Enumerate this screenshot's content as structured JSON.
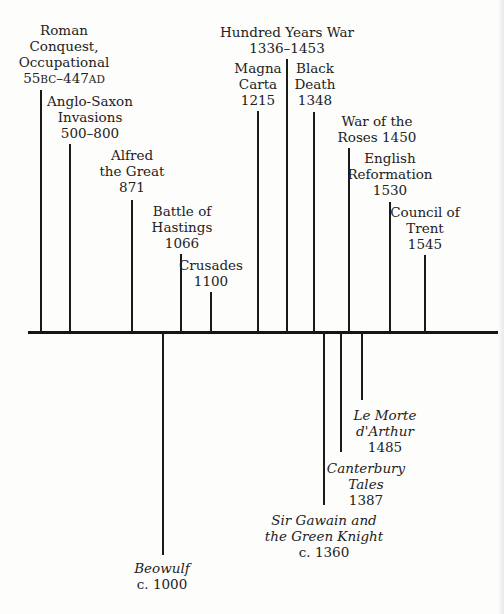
{
  "timeline": {
    "axis_color": "#151515",
    "above": [
      {
        "id": "roman",
        "lines": [
          "Roman",
          "Conquest,",
          "Occupational"
        ],
        "date": "55BC–447AD",
        "x": 41,
        "top": 90,
        "label_x": 64,
        "label_y": 22
      },
      {
        "id": "anglo-saxon",
        "lines": [
          "Anglo-Saxon",
          "Invasions"
        ],
        "date": "500–800",
        "x": 70,
        "top": 144,
        "label_x": 90,
        "label_y": 93
      },
      {
        "id": "alfred",
        "lines": [
          "Alfred",
          "the Great"
        ],
        "date": "871",
        "x": 132,
        "top": 200,
        "label_x": 132,
        "label_y": 147
      },
      {
        "id": "hastings",
        "lines": [
          "Battle of",
          "Hastings"
        ],
        "date": "1066",
        "x": 181,
        "top": 254,
        "label_x": 182,
        "label_y": 203
      },
      {
        "id": "crusades",
        "lines": [
          "Crusades"
        ],
        "date": "1100",
        "x": 211,
        "top": 292,
        "label_x": 211,
        "label_y": 257
      },
      {
        "id": "magna-carta",
        "lines": [
          "Magna",
          "Carta"
        ],
        "date": "1215",
        "x": 258,
        "top": 111,
        "label_x": 258,
        "label_y": 60
      },
      {
        "id": "hundred-years-war",
        "lines": [
          "Hundred Years War"
        ],
        "date": "1336–1453",
        "x": 287,
        "top": 59,
        "label_x": 287,
        "label_y": 24
      },
      {
        "id": "black-death",
        "lines": [
          "Black",
          "Death"
        ],
        "date": "1348",
        "x": 314,
        "top": 112,
        "label_x": 315,
        "label_y": 60
      },
      {
        "id": "war-of-roses",
        "lines": [
          "War of the",
          "Roses 1450"
        ],
        "date": "",
        "x": 349,
        "top": 148,
        "label_x": 377,
        "label_y": 113
      },
      {
        "id": "reformation",
        "lines": [
          "English",
          "Reformation"
        ],
        "date": "1530",
        "x": 390,
        "top": 202,
        "label_x": 390,
        "label_y": 150
      },
      {
        "id": "trent",
        "lines": [
          "Council of",
          "Trent"
        ],
        "date": "1545",
        "x": 425,
        "top": 255,
        "label_x": 425,
        "label_y": 204
      }
    ],
    "below": [
      {
        "id": "beowulf",
        "lines": [
          "Beowulf"
        ],
        "date": "c. 1000",
        "x": 163,
        "bottom": 555,
        "label_x": 162,
        "label_y": 560
      },
      {
        "id": "gawain",
        "lines": [
          "Sir Gawain and",
          "the Green Knight"
        ],
        "date": "c. 1360",
        "x": 324,
        "bottom": 505,
        "label_x": 324,
        "label_y": 512
      },
      {
        "id": "canterbury",
        "lines": [
          "Canterbury",
          "Tales"
        ],
        "date": "1387",
        "x": 341,
        "bottom": 452,
        "label_x": 366,
        "label_y": 460
      },
      {
        "id": "morte",
        "lines": [
          "Le Morte",
          "d'Arthur"
        ],
        "date": "1485",
        "x": 362,
        "bottom": 400,
        "label_x": 385,
        "label_y": 407
      }
    ]
  }
}
